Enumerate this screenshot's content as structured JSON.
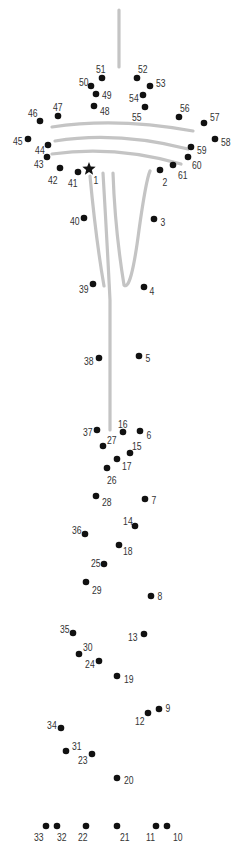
{
  "puzzle": {
    "title": "",
    "colors": {
      "dot": "#111111",
      "label": "#333333",
      "guide": "#c4c4c4"
    },
    "start_marker": {
      "type": "star-icon",
      "x": 89,
      "y": 169
    },
    "guides": [
      "M119,10 L119,67",
      "M52,127 Q117,117 193,131",
      "M55,141 Q117,131 188,149",
      "M52,154 Q115,145 181,164",
      "M90,176 Q96,240 104,286",
      "M103,173 Q107,240 110,300 Q110,380 110,430",
      "M113,173 Q115,230 124,285 Q131,292 139,230 Q146,180 150,171"
    ],
    "dots": [
      {
        "n": "1",
        "x": 89,
        "y": 169,
        "lx": 93,
        "ly": 181,
        "star": true
      },
      {
        "n": "2",
        "x": 160,
        "y": 170,
        "lx": 162,
        "ly": 183
      },
      {
        "n": "3",
        "x": 154,
        "y": 219,
        "lx": 160,
        "ly": 223
      },
      {
        "n": "4",
        "x": 144,
        "y": 287,
        "lx": 149,
        "ly": 292
      },
      {
        "n": "5",
        "x": 139,
        "y": 356,
        "lx": 145,
        "ly": 359
      },
      {
        "n": "6",
        "x": 140,
        "y": 431,
        "lx": 146,
        "ly": 436
      },
      {
        "n": "7",
        "x": 145,
        "y": 499,
        "lx": 151,
        "ly": 501
      },
      {
        "n": "8",
        "x": 151,
        "y": 596,
        "lx": 157,
        "ly": 597
      },
      {
        "n": "9",
        "x": 159,
        "y": 709,
        "lx": 165,
        "ly": 709
      },
      {
        "n": "10",
        "x": 167,
        "y": 826,
        "lx": 172,
        "ly": 838
      },
      {
        "n": "11",
        "x": 156,
        "y": 826,
        "lx": 145,
        "ly": 838
      },
      {
        "n": "12",
        "x": 148,
        "y": 713,
        "lx": 134,
        "ly": 722
      },
      {
        "n": "13",
        "x": 144,
        "y": 634,
        "lx": 127,
        "ly": 638
      },
      {
        "n": "14",
        "x": 135,
        "y": 526,
        "lx": 122,
        "ly": 522
      },
      {
        "n": "15",
        "x": 130,
        "y": 453,
        "lx": 131,
        "ly": 447
      },
      {
        "n": "16",
        "x": 123,
        "y": 432,
        "lx": 117,
        "ly": 425
      },
      {
        "n": "17",
        "x": 117,
        "y": 459,
        "lx": 121,
        "ly": 467
      },
      {
        "n": "18",
        "x": 119,
        "y": 545,
        "lx": 122,
        "ly": 552
      },
      {
        "n": "19",
        "x": 117,
        "y": 676,
        "lx": 123,
        "ly": 680
      },
      {
        "n": "20",
        "x": 117,
        "y": 778,
        "lx": 123,
        "ly": 781
      },
      {
        "n": "21",
        "x": 117,
        "y": 826,
        "lx": 119,
        "ly": 838
      },
      {
        "n": "22",
        "x": 86,
        "y": 826,
        "lx": 77,
        "ly": 838
      },
      {
        "n": "23",
        "x": 92,
        "y": 754,
        "lx": 77,
        "ly": 761
      },
      {
        "n": "24",
        "x": 99,
        "y": 661,
        "lx": 84,
        "ly": 665
      },
      {
        "n": "25",
        "x": 104,
        "y": 564,
        "lx": 90,
        "ly": 564
      },
      {
        "n": "26",
        "x": 107,
        "y": 468,
        "lx": 106,
        "ly": 481
      },
      {
        "n": "27",
        "x": 103,
        "y": 446,
        "lx": 106,
        "ly": 441
      },
      {
        "n": "28",
        "x": 96,
        "y": 496,
        "lx": 101,
        "ly": 503
      },
      {
        "n": "29",
        "x": 86,
        "y": 582,
        "lx": 91,
        "ly": 591
      },
      {
        "n": "30",
        "x": 79,
        "y": 654,
        "lx": 82,
        "ly": 648
      },
      {
        "n": "31",
        "x": 66,
        "y": 751,
        "lx": 71,
        "ly": 747
      },
      {
        "n": "32",
        "x": 57,
        "y": 826,
        "lx": 56,
        "ly": 838
      },
      {
        "n": "33",
        "x": 46,
        "y": 826,
        "lx": 33,
        "ly": 838
      },
      {
        "n": "34",
        "x": 61,
        "y": 728,
        "lx": 46,
        "ly": 726
      },
      {
        "n": "35",
        "x": 73,
        "y": 633,
        "lx": 59,
        "ly": 630
      },
      {
        "n": "36",
        "x": 85,
        "y": 534,
        "lx": 71,
        "ly": 531
      },
      {
        "n": "37",
        "x": 97,
        "y": 430,
        "lx": 82,
        "ly": 433
      },
      {
        "n": "38",
        "x": 99,
        "y": 358,
        "lx": 83,
        "ly": 362
      },
      {
        "n": "39",
        "x": 93,
        "y": 284,
        "lx": 78,
        "ly": 290
      },
      {
        "n": "40",
        "x": 84,
        "y": 218,
        "lx": 69,
        "ly": 222
      },
      {
        "n": "41",
        "x": 78,
        "y": 172,
        "lx": 67,
        "ly": 184
      },
      {
        "n": "42",
        "x": 60,
        "y": 168,
        "lx": 47,
        "ly": 181
      },
      {
        "n": "43",
        "x": 47,
        "y": 157,
        "lx": 33,
        "ly": 165
      },
      {
        "n": "44",
        "x": 48,
        "y": 145,
        "lx": 34,
        "ly": 151
      },
      {
        "n": "45",
        "x": 28,
        "y": 139,
        "lx": 12,
        "ly": 142
      },
      {
        "n": "46",
        "x": 40,
        "y": 121,
        "lx": 27,
        "ly": 114
      },
      {
        "n": "47",
        "x": 58,
        "y": 116,
        "lx": 52,
        "ly": 108
      },
      {
        "n": "48",
        "x": 94,
        "y": 106,
        "lx": 99,
        "ly": 112
      },
      {
        "n": "49",
        "x": 96,
        "y": 94,
        "lx": 101,
        "ly": 96
      },
      {
        "n": "50",
        "x": 91,
        "y": 86,
        "lx": 78,
        "ly": 83
      },
      {
        "n": "51",
        "x": 102,
        "y": 78,
        "lx": 95,
        "ly": 70
      },
      {
        "n": "52",
        "x": 137,
        "y": 78,
        "lx": 137,
        "ly": 70
      },
      {
        "n": "53",
        "x": 150,
        "y": 86,
        "lx": 155,
        "ly": 84
      },
      {
        "n": "54",
        "x": 143,
        "y": 95,
        "lx": 128,
        "ly": 99
      },
      {
        "n": "55",
        "x": 145,
        "y": 107,
        "lx": 131,
        "ly": 118
      },
      {
        "n": "56",
        "x": 179,
        "y": 117,
        "lx": 179,
        "ly": 109
      },
      {
        "n": "57",
        "x": 204,
        "y": 123,
        "lx": 209,
        "ly": 118
      },
      {
        "n": "58",
        "x": 215,
        "y": 139,
        "lx": 220,
        "ly": 143
      },
      {
        "n": "59",
        "x": 191,
        "y": 147,
        "lx": 196,
        "ly": 151
      },
      {
        "n": "60",
        "x": 188,
        "y": 157,
        "lx": 191,
        "ly": 166
      },
      {
        "n": "61",
        "x": 173,
        "y": 165,
        "lx": 177,
        "ly": 176
      }
    ]
  }
}
